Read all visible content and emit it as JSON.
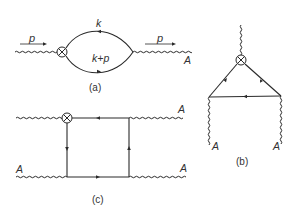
{
  "diagrams": {
    "a": {
      "caption": "(a)",
      "momentum_in": "p",
      "momentum_out": "p",
      "loop_top": "k",
      "loop_bottom": "k+p",
      "field_label": "A"
    },
    "b": {
      "caption": "(b)",
      "field_left": "A",
      "field_right": "A"
    },
    "c": {
      "caption": "(c)",
      "field_top_right": "A",
      "field_bottom_left": "A",
      "field_bottom_right": "A"
    }
  },
  "colors": {
    "line": "#2a2a2a",
    "text": "#333333"
  }
}
